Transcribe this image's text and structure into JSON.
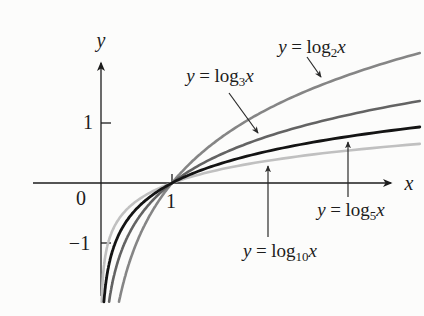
{
  "figure": {
    "background": "#fcfcfb",
    "axis_color": "#1c1c1c"
  },
  "axes": {
    "x_label": "x",
    "y_label": "y",
    "origin_label": "0",
    "x_ticks": [
      {
        "value": 1,
        "label": "1"
      }
    ],
    "y_ticks": [
      {
        "value": 1,
        "label": "1"
      },
      {
        "value": -1,
        "label": "−1"
      }
    ]
  },
  "chart_data": {
    "type": "line",
    "title": "",
    "xlabel": "x",
    "ylabel": "y",
    "xlim": [
      -0.96,
      4.55
    ],
    "ylim": [
      -2.1,
      2.2
    ],
    "grid": false,
    "common_point": [
      1,
      0
    ],
    "series": [
      {
        "name": "log2",
        "label": "y = log2 x",
        "base": 2,
        "color": "#858585"
      },
      {
        "name": "log3",
        "label": "y = log3 x",
        "base": 3,
        "color": "#636363"
      },
      {
        "name": "log5",
        "label": "y = log5 x",
        "base": 5,
        "color": "#141414"
      },
      {
        "name": "log10",
        "label": "y = log10 x",
        "base": 10,
        "color": "#c0c0c0"
      }
    ]
  },
  "annotations": [
    {
      "lhs": "y",
      "eq": "=",
      "func": "log",
      "base": "2",
      "arg": "x"
    },
    {
      "lhs": "y",
      "eq": "=",
      "func": "log",
      "base": "3",
      "arg": "x"
    },
    {
      "lhs": "y",
      "eq": "=",
      "func": "log",
      "base": "5",
      "arg": "x"
    },
    {
      "lhs": "y",
      "eq": "=",
      "func": "log",
      "base": "10",
      "arg": "x"
    }
  ]
}
